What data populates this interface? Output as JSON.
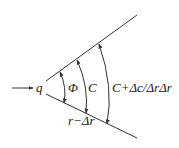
{
  "diagram": {
    "labels": {
      "source": "q",
      "inner_angle": "Φ",
      "middle_arc": "C",
      "outer_arc": "C+Δc/ΔrΔr",
      "radius": "r−Δr"
    },
    "colors": {
      "stroke": "#333333",
      "text": "#222222",
      "background": "#ffffff"
    }
  }
}
